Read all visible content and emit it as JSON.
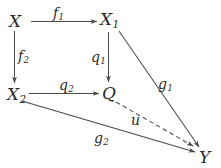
{
  "diagram": {
    "type": "commutative-diagram",
    "background_color": "#ffffff",
    "stroke_color": "#4a4a4a",
    "text_color": "#2b2b2b",
    "nodes": [
      {
        "id": "X",
        "label": "X",
        "sub": "",
        "x": 16,
        "y": 21
      },
      {
        "id": "X1",
        "label": "X",
        "sub": "1",
        "x": 107,
        "y": 19
      },
      {
        "id": "X2",
        "label": "X",
        "sub": "2",
        "x": 14,
        "y": 94
      },
      {
        "id": "Q",
        "label": "Q",
        "sub": "",
        "x": 109,
        "y": 93
      },
      {
        "id": "Y",
        "label": "Y",
        "sub": "",
        "x": 205,
        "y": 157
      }
    ],
    "edges": [
      {
        "id": "f1",
        "from": "X",
        "to": "X1",
        "label": "f",
        "sub": "1",
        "style": "solid",
        "arrow": true
      },
      {
        "id": "f2",
        "from": "X",
        "to": "X2",
        "label": "f",
        "sub": "2",
        "style": "solid",
        "arrow": true
      },
      {
        "id": "q1",
        "from": "X1",
        "to": "Q",
        "label": "q",
        "sub": "1",
        "style": "solid",
        "arrow": true
      },
      {
        "id": "q2",
        "from": "X2",
        "to": "Q",
        "label": "q",
        "sub": "2",
        "style": "solid",
        "arrow": true
      },
      {
        "id": "g1",
        "from": "X1",
        "to": "Y",
        "label": "g",
        "sub": "1",
        "style": "solid",
        "arrow": true
      },
      {
        "id": "g2",
        "from": "X2",
        "to": "Y",
        "label": "g",
        "sub": "2",
        "style": "solid",
        "arrow": true
      },
      {
        "id": "u",
        "from": "Q",
        "to": "Y",
        "label": "u",
        "sub": "",
        "style": "dashed",
        "arrow": true
      }
    ]
  }
}
